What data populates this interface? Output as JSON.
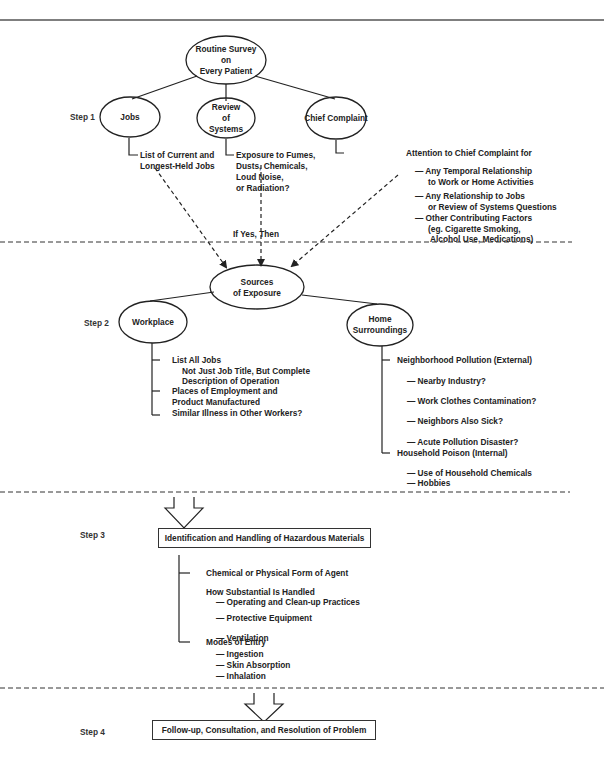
{
  "diagram": {
    "root": "Routine Survey\non\nEvery Patient",
    "steps": {
      "step1": "Step 1",
      "step2": "Step 2",
      "step3": "Step 3",
      "step4": "Step 4"
    },
    "step1_nodes": {
      "jobs": "Jobs",
      "review": "Review\nof\nSystems",
      "chief": "Chief Complaint"
    },
    "jobs_note": [
      "List of Current and",
      "Longest-Held Jobs"
    ],
    "review_note": [
      "Exposure to Fumes,",
      "Dusts, Chemicals,",
      "Loud Noise,",
      "or Radiation?"
    ],
    "chief_note": {
      "title": "Attention to Chief Complaint for",
      "items": [
        [
          "— Any Temporal Relationship",
          "to Work or Home Activities"
        ],
        [
          "— Any Relationship to Jobs",
          "or Review of Systems Questions"
        ],
        [
          "— Other Contributing Factors",
          "(eg. Cigarette Smoking,",
          "Alcohol Use, Medications)"
        ]
      ]
    },
    "if_yes": "If Yes, Then",
    "sources": "Sources\nof Exposure",
    "workplace": {
      "label": "Workplace",
      "items": [
        "List All Jobs",
        "Not Just Job Title, But Complete",
        "Description of Operation",
        "Places of Employment and",
        "Product Manufactured",
        "Similar Illness in Other Workers?"
      ]
    },
    "home": {
      "label": "Home\nSurroundings",
      "external": "Neighborhood Pollution (External)",
      "external_items": [
        "— Nearby Industry?",
        "— Work Clothes Contamination?",
        "— Neighbors  Also Sick?",
        "— Acute Pollution Disaster?"
      ],
      "internal": "Household Poison (Internal)",
      "internal_items": [
        "— Use of Household Chemicals",
        "— Hobbies"
      ]
    },
    "step3_box": "Identification and Handling of Hazardous Materials",
    "step3_items": {
      "form": "Chemical or Physical Form of Agent",
      "handled": "How Substantial Is Handled",
      "handled_items": [
        "— Operating and Clean-up Practices",
        "— Protective  Equipment",
        "— Ventilation"
      ],
      "modes": "Modes of Entry",
      "modes_items": [
        "— Ingestion",
        "— Skin Absorption",
        "— Inhalation"
      ]
    },
    "step4_box": "Follow-up, Consultation, and Resolution of Problem"
  }
}
